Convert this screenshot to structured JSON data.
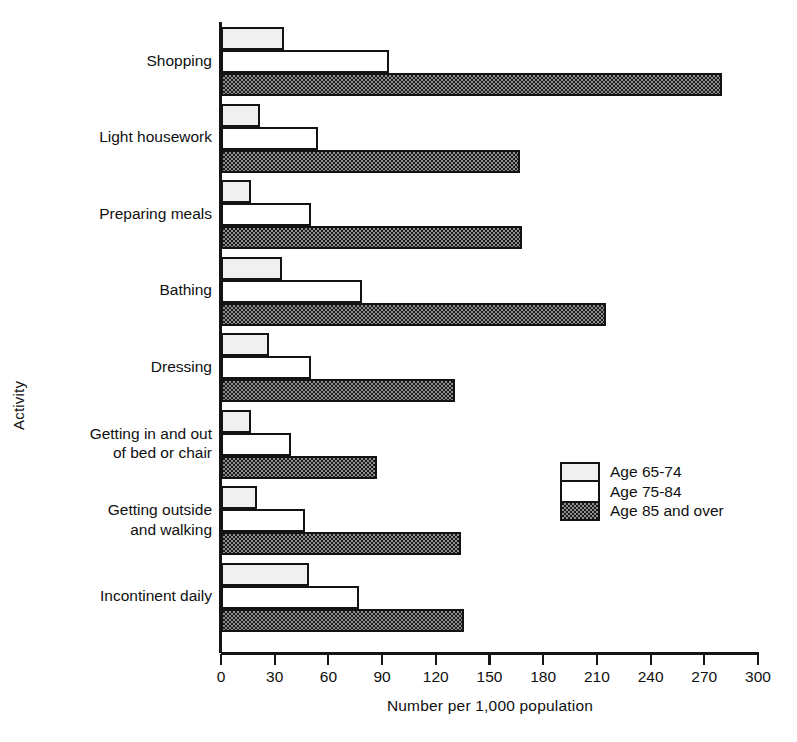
{
  "chart_data": {
    "type": "bar",
    "orientation": "horizontal",
    "title": "",
    "xlabel": "Number per 1,000 population",
    "ylabel": "Activity",
    "xlim": [
      0,
      300
    ],
    "xticks": [
      0,
      30,
      60,
      90,
      120,
      150,
      180,
      210,
      240,
      270,
      300
    ],
    "grid": false,
    "legend_position": "center-right",
    "categories": [
      "Shopping",
      "Light housework",
      "Preparing meals",
      "Bathing",
      "Dressing",
      "Getting in and out\nof bed or chair",
      "Getting outside\nand walking",
      "Incontinent daily"
    ],
    "series": [
      {
        "name": "Age 65-74",
        "pattern": "light-stipple",
        "color": "#f0f0f0",
        "values": [
          35,
          22,
          17,
          34,
          27,
          17,
          20,
          49
        ]
      },
      {
        "name": "Age 75-84",
        "pattern": "white",
        "color": "#ffffff",
        "values": [
          94,
          54,
          50,
          79,
          50,
          39,
          47,
          77
        ]
      },
      {
        "name": "Age 85 and over",
        "pattern": "dark-stipple",
        "color": "#1b1b1b",
        "values": [
          280,
          167,
          168,
          215,
          131,
          87,
          134,
          136
        ]
      }
    ]
  },
  "legend": {
    "items": [
      {
        "label": "Age 65-74"
      },
      {
        "label": "Age 75-84"
      },
      {
        "label": "Age 85 and over"
      }
    ]
  },
  "axis": {
    "x_title": "Number per 1,000 population",
    "y_title": "Activity",
    "tick_labels": [
      "0",
      "30",
      "60",
      "90",
      "120",
      "150",
      "180",
      "210",
      "240",
      "270",
      "300"
    ]
  }
}
